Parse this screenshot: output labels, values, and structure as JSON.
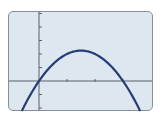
{
  "chart_data": {
    "type": "line",
    "title": "",
    "xlabel": "",
    "ylabel": "",
    "function": "y = 3x - x^2",
    "series": [
      {
        "name": "parabola",
        "x": [
          -0.6,
          0,
          0.5,
          1,
          1.5,
          2,
          2.5,
          3,
          3.6
        ],
        "values": [
          -2.16,
          0,
          1.25,
          2,
          2.25,
          2,
          1.25,
          0,
          -2.16
        ]
      }
    ],
    "xlim": [
      -1.1,
      4.1
    ],
    "ylim": [
      -2.2,
      5.0
    ],
    "x_ticks": [
      1,
      2,
      3
    ],
    "y_ticks": [
      -2,
      -1,
      1,
      2,
      3,
      4,
      5
    ],
    "grid": false,
    "legend": "none"
  },
  "colors": {
    "screen_background": "#dde7f0",
    "frame": "#8a8f96",
    "axis": "#5a5f66",
    "curve": "#283c78"
  }
}
